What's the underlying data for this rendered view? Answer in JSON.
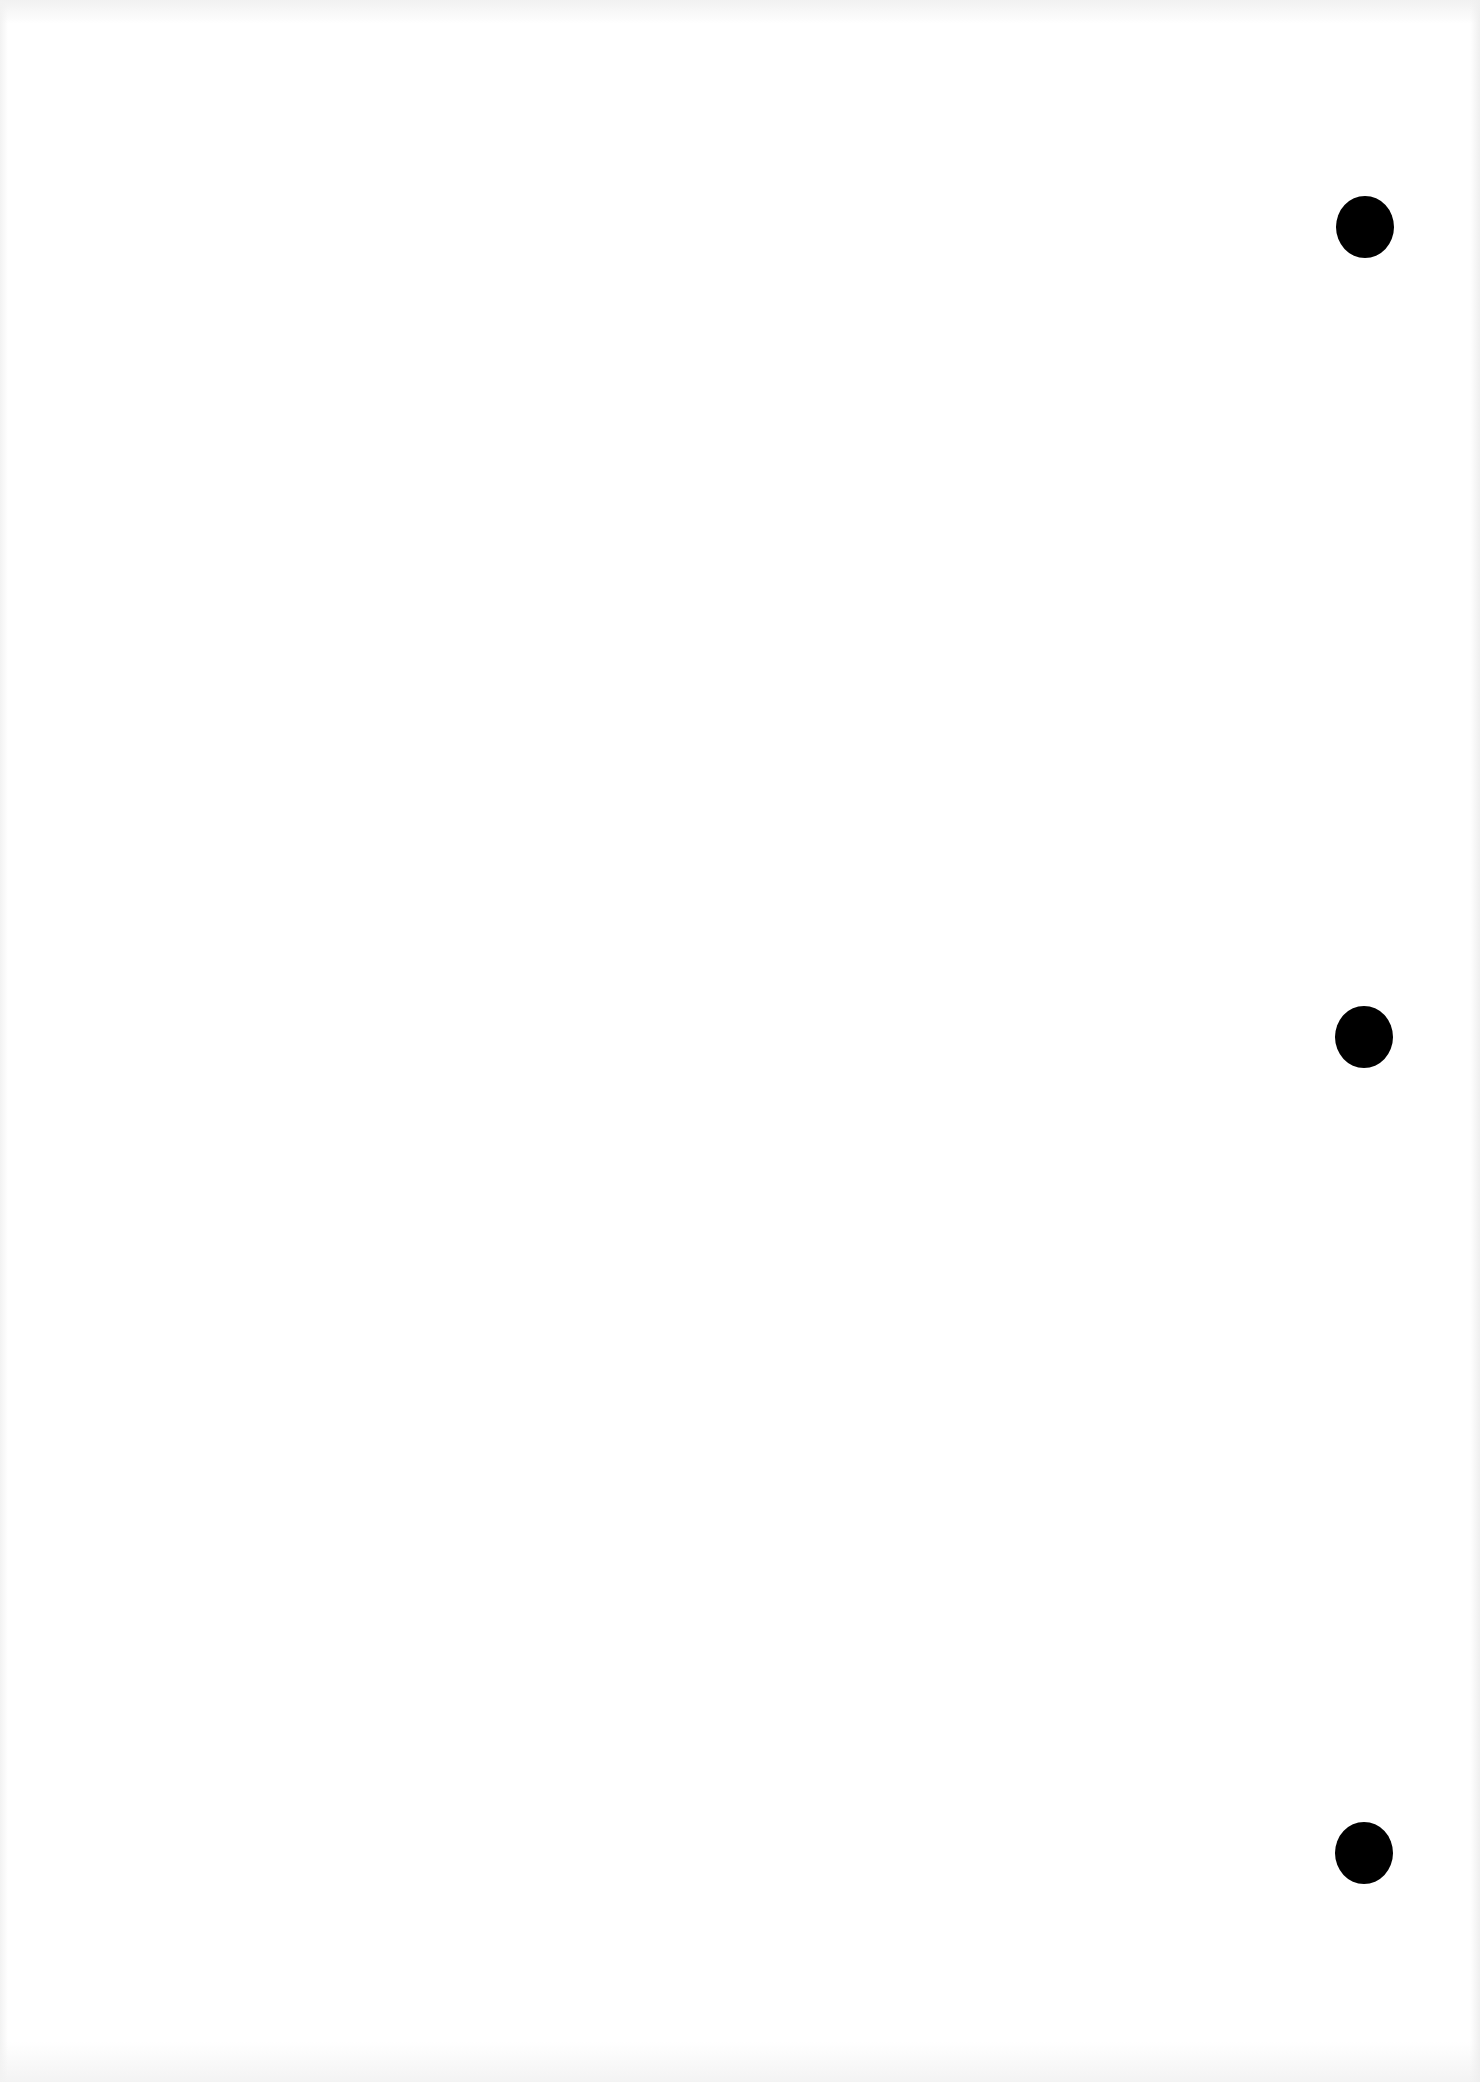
{
  "document": {
    "type": "blank scanned page",
    "text": ""
  },
  "punch_holes": [
    {
      "x": 1336,
      "y": 196,
      "color": "#000000"
    },
    {
      "x": 1335,
      "y": 1006,
      "color": "#000000"
    },
    {
      "x": 1335,
      "y": 1822,
      "color": "#000000"
    }
  ]
}
